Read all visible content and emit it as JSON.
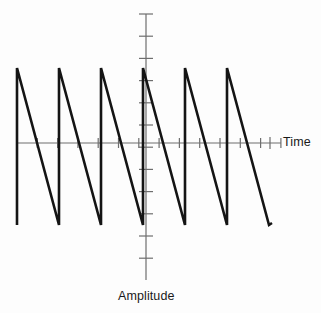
{
  "figure": {
    "title": "",
    "background_color": "#fdfdfd",
    "wave_color": "#141414",
    "axis_color": "#6e6e6e",
    "label_color": "#1a1a1a"
  },
  "axes": {
    "x_axis": {
      "label": "Time",
      "line_y": 143,
      "x_start": 17,
      "x_end": 281,
      "tick_half_length": 5,
      "tick_spacing": 20.3,
      "tick_count": 14,
      "arrow_tick_x": 270
    },
    "y_axis": {
      "label": "Amplitude",
      "line_x": 146,
      "y_start": 14,
      "y_end": 280,
      "tick_half_length": 7,
      "tick_spacing": 22.2,
      "tick_count": 13
    }
  },
  "chart_data": {
    "type": "line",
    "title": "",
    "subtitle": "",
    "xlabel": "Time",
    "ylabel": "Amplitude",
    "waveform": "sawtooth",
    "legend": [],
    "grid": false,
    "axis_origin_px": {
      "x": 146,
      "y": 143
    },
    "amplitude_peak_px": 68,
    "amplitude_trough_px": 225,
    "period_px": 42,
    "cycles": 6,
    "peak_value": 1,
    "trough_value": -1,
    "ylim": [
      -1.12,
      1.12
    ],
    "xlim": [
      0,
      6.07
    ],
    "x": [
      0,
      0,
      1,
      1,
      2,
      2,
      3,
      3,
      4,
      4,
      5,
      5,
      6,
      6.07
    ],
    "y": [
      -1,
      1,
      -1,
      1,
      -1,
      1,
      -1,
      1,
      -1,
      1,
      -1,
      1,
      -1,
      -1
    ],
    "points_px": [
      {
        "x": 17,
        "y": 225
      },
      {
        "x": 17,
        "y": 68
      },
      {
        "x": 59,
        "y": 225
      },
      {
        "x": 59,
        "y": 68
      },
      {
        "x": 101,
        "y": 225
      },
      {
        "x": 101,
        "y": 68
      },
      {
        "x": 143,
        "y": 225
      },
      {
        "x": 143,
        "y": 68
      },
      {
        "x": 185,
        "y": 225
      },
      {
        "x": 185,
        "y": 68
      },
      {
        "x": 227,
        "y": 225
      },
      {
        "x": 227,
        "y": 68
      },
      {
        "x": 269,
        "y": 225
      },
      {
        "x": 272,
        "y": 223
      }
    ],
    "x_tick_labels": [],
    "y_tick_labels": []
  }
}
